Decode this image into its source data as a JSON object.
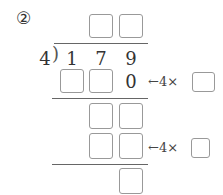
{
  "problem": {
    "number_label": "②",
    "divisor": "4",
    "dividend_digits": [
      "1",
      "7",
      "9"
    ],
    "step1_known_digit": "0",
    "hint_arrow": "←",
    "hint_text": "4×"
  }
}
